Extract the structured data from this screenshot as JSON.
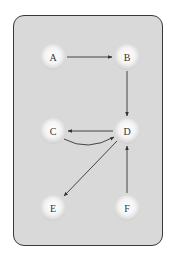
{
  "diagram": {
    "type": "directed-graph",
    "colors": {
      "panel_background": "#d9d9d9",
      "panel_border": "#3a3a3a",
      "node_fill": "#f2f2f2",
      "edge": "#333333",
      "label": "#333333"
    },
    "nodes": [
      {
        "id": "A",
        "label": "A"
      },
      {
        "id": "B",
        "label": "B"
      },
      {
        "id": "C",
        "label": "C"
      },
      {
        "id": "D",
        "label": "D"
      },
      {
        "id": "E",
        "label": "E"
      },
      {
        "id": "F",
        "label": "F"
      }
    ],
    "edges": [
      {
        "from": "A",
        "to": "B",
        "style": "straight"
      },
      {
        "from": "B",
        "to": "D",
        "style": "straight"
      },
      {
        "from": "D",
        "to": "C",
        "style": "straight"
      },
      {
        "from": "C",
        "to": "D",
        "style": "curved"
      },
      {
        "from": "D",
        "to": "E",
        "style": "straight"
      },
      {
        "from": "F",
        "to": "D",
        "style": "straight"
      }
    ]
  }
}
